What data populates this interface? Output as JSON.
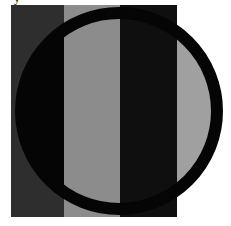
{
  "figure": {
    "caption_fragment": "y",
    "square": {
      "x": 11,
      "y": 5,
      "width": 166,
      "height": 212
    },
    "stripes": [
      {
        "name": "left",
        "x": 11,
        "width": 53,
        "color": "#2e2e2e",
        "inside_circle_color": "#050505"
      },
      {
        "name": "middle",
        "x": 64,
        "width": 56,
        "color": "#8c8c8c",
        "inside_circle_color": "#8c8c8c"
      },
      {
        "name": "right",
        "x": 120,
        "width": 57,
        "color": "#0f0f0f",
        "inside_circle_color": "#0f0f0f"
      }
    ],
    "ring": {
      "cx": 119,
      "cy": 111,
      "r": 98,
      "stroke_width": 12,
      "color": "#050505"
    },
    "outside_square_circle_fill": "#a0a0a0",
    "background": "#ffffff"
  }
}
